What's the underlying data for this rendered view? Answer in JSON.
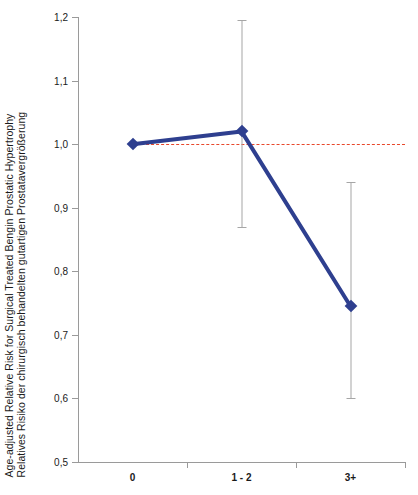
{
  "chart_data": {
    "type": "line",
    "title": "",
    "subtitle": "",
    "xlabel": "",
    "ylabel_en": "Age-adjusted Relative Risk for Surgical Treated Bengin Prostatic Hypertrophy",
    "ylabel_de": "Relatives Risiko der chirurgisch behandelten gutartigen Prostatavergrößerung",
    "categories": [
      "0",
      "1 - 2",
      "3+"
    ],
    "values": [
      1.0,
      1.02,
      0.745
    ],
    "error_low": [
      null,
      0.87,
      0.6
    ],
    "error_high": [
      null,
      1.195,
      0.94
    ],
    "ylim": [
      0.5,
      1.2
    ],
    "ytick_labels": [
      "1,2",
      "1,1",
      "1,0",
      "0,9",
      "0,8",
      "0,7",
      "0,6",
      "0,5"
    ],
    "ytick_values": [
      1.2,
      1.1,
      1.0,
      0.9,
      0.8,
      0.7,
      0.6,
      0.5
    ],
    "xtick_labels": [
      "0",
      "1 - 2",
      "3+"
    ],
    "grid": false,
    "legend": null,
    "reference_line": {
      "value": 1.0,
      "style": "dashed",
      "color": "#e8472b"
    },
    "series_color": "#2e3f8f",
    "errorbar_color": "#a6a6a6",
    "axis_color": "#9a9a9a",
    "marker_shape": "diamond"
  }
}
